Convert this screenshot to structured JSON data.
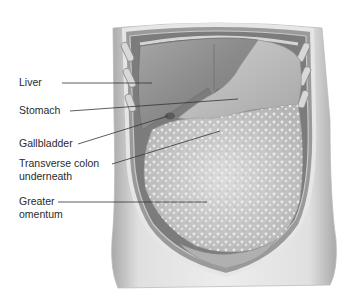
{
  "diagram": {
    "type": "anatomical-illustration",
    "labels": [
      {
        "id": "liver",
        "text": "Liver",
        "lines": [
          "Liver"
        ]
      },
      {
        "id": "stomach",
        "text": "Stomach",
        "lines": [
          "Stomach"
        ]
      },
      {
        "id": "gallbladder",
        "text": "Gallbladder",
        "lines": [
          "Gallbladder"
        ]
      },
      {
        "id": "transverse-colon",
        "text": "Transverse colon underneath",
        "lines": [
          "Transverse colon",
          "underneath"
        ]
      },
      {
        "id": "greater-omentum",
        "text": "Greater omentum",
        "lines": [
          "Greater",
          "omentum"
        ]
      }
    ],
    "colors": {
      "background": "#ffffff",
      "skin": "#c9c9c9",
      "skin_shadow": "#8f8f8f",
      "liver": "#8c8c8c",
      "stomach": "#b8b8b8",
      "omentum": "#d2d2d2",
      "leader_line": "#333333",
      "label_text": "#2a2a2a"
    }
  }
}
